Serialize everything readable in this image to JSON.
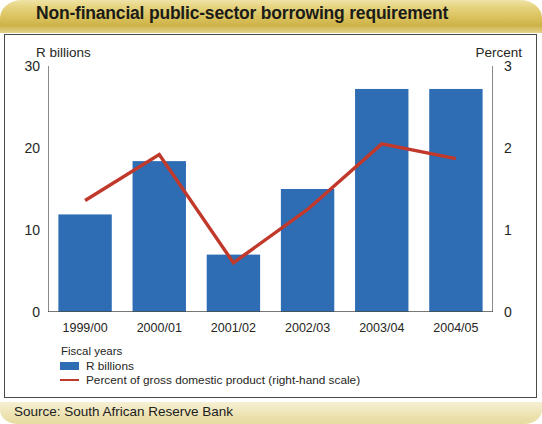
{
  "title": "Non-financial public-sector borrowing requirement",
  "source_label": "Source: South African Reserve Bank",
  "chart_data": {
    "type": "bar",
    "title": "Non-financial public-sector borrowing requirement",
    "xlabel": "Fiscal years",
    "categories": [
      "1999/00",
      "2000/01",
      "2001/02",
      "2002/03",
      "2003/04",
      "2004/05"
    ],
    "grid": false,
    "legend_position": "bottom-left",
    "legend_title": "Fiscal years",
    "series": [
      {
        "name": "R billions",
        "type": "bar",
        "axis": "left",
        "color": "#2E6DB4",
        "values": [
          11.9,
          18.4,
          7.0,
          15.0,
          27.2,
          27.2
        ]
      },
      {
        "name": "Percent of gross domestic product (right-hand scale)",
        "type": "line",
        "axis": "right",
        "color": "#C0392B",
        "values": [
          1.36,
          1.92,
          0.6,
          1.25,
          2.05,
          1.87
        ]
      }
    ],
    "left_axis": {
      "label": "R billions",
      "ticks": [
        0,
        10,
        20,
        30
      ],
      "tick_labels": [
        "0",
        "10",
        "20",
        "30"
      ],
      "ylim": [
        0,
        30
      ]
    },
    "right_axis": {
      "label": "Percent",
      "ticks": [
        0,
        1,
        2,
        3
      ],
      "tick_labels": [
        "0",
        "1",
        "2",
        "3"
      ],
      "ylim": [
        0,
        3
      ]
    }
  },
  "colors": {
    "bar": "#2E6DB4",
    "line": "#C0392B",
    "banner_gold": "#d9c05a",
    "source_band": "#efe6bd",
    "frame": "#4a4a46",
    "text": "#262622"
  }
}
